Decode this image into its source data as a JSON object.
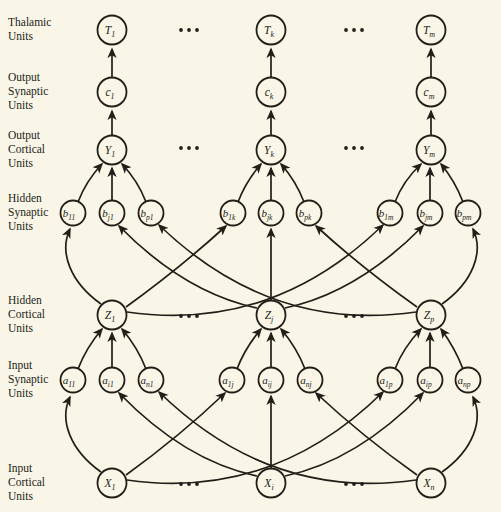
{
  "diagram": {
    "width": 501,
    "height": 512,
    "colors": {
      "background": "#f9f5e7",
      "ink": "#221e18"
    },
    "row_labels": [
      {
        "id": "thalamic-units",
        "lines": [
          "Thalamic",
          "Units"
        ],
        "x": 8,
        "y": 26
      },
      {
        "id": "output-synaptic-units",
        "lines": [
          "Output",
          "Synaptic",
          "Units"
        ],
        "x": 8,
        "y": 81
      },
      {
        "id": "output-cortical-units",
        "lines": [
          "Output",
          "Cortical",
          "Units"
        ],
        "x": 8,
        "y": 139
      },
      {
        "id": "hidden-synaptic-units",
        "lines": [
          "Hidden",
          "Synaptic",
          "Units"
        ],
        "x": 8,
        "y": 202
      },
      {
        "id": "hidden-cortical-units",
        "lines": [
          "Hidden",
          "Cortical",
          "Units"
        ],
        "x": 8,
        "y": 304
      },
      {
        "id": "input-synaptic-units",
        "lines": [
          "Input",
          "Synaptic",
          "Units"
        ],
        "x": 8,
        "y": 369
      },
      {
        "id": "input-cortical-units",
        "lines": [
          "Input",
          "Cortical",
          "Units"
        ],
        "x": 8,
        "y": 472
      }
    ],
    "nodes": [
      {
        "id": "T1",
        "base": "T",
        "sub": "1",
        "x": 112,
        "y": 30,
        "r": 14.5
      },
      {
        "id": "Tk",
        "base": "T",
        "sub": "k",
        "x": 271,
        "y": 30,
        "r": 14.5
      },
      {
        "id": "Tm",
        "base": "T",
        "sub": "m",
        "x": 431,
        "y": 30,
        "r": 14.5
      },
      {
        "id": "c1",
        "base": "c",
        "sub": "1",
        "x": 112,
        "y": 92,
        "r": 14.5
      },
      {
        "id": "ck",
        "base": "c",
        "sub": "k",
        "x": 271,
        "y": 92,
        "r": 14.5
      },
      {
        "id": "cm",
        "base": "c",
        "sub": "m",
        "x": 431,
        "y": 92,
        "r": 14.5
      },
      {
        "id": "Y1",
        "base": "Y",
        "sub": "1",
        "x": 112,
        "y": 150,
        "r": 14.5
      },
      {
        "id": "Yk",
        "base": "Y",
        "sub": "k",
        "x": 271,
        "y": 150,
        "r": 14.5
      },
      {
        "id": "Ym",
        "base": "Y",
        "sub": "m",
        "x": 431,
        "y": 150,
        "r": 14.5
      },
      {
        "id": "b11",
        "base": "b",
        "sub": "11",
        "x": 73,
        "y": 213,
        "r": 12.5
      },
      {
        "id": "bj1",
        "base": "b",
        "sub": "j1",
        "x": 112,
        "y": 213,
        "r": 12.5
      },
      {
        "id": "bp1",
        "base": "b",
        "sub": "p1",
        "x": 151,
        "y": 213,
        "r": 12.5
      },
      {
        "id": "b1k",
        "base": "b",
        "sub": "1k",
        "x": 233,
        "y": 213,
        "r": 12.5
      },
      {
        "id": "bjk",
        "base": "b",
        "sub": "jk",
        "x": 271,
        "y": 213,
        "r": 12.5
      },
      {
        "id": "bpk",
        "base": "b",
        "sub": "pk",
        "x": 309,
        "y": 213,
        "r": 12.5
      },
      {
        "id": "b1m",
        "base": "b",
        "sub": "1m",
        "x": 390,
        "y": 213,
        "r": 12.5
      },
      {
        "id": "bjm",
        "base": "b",
        "sub": "jm",
        "x": 430,
        "y": 213,
        "r": 12.5
      },
      {
        "id": "bpm",
        "base": "b",
        "sub": "pm",
        "x": 468,
        "y": 213,
        "r": 12.5
      },
      {
        "id": "Z1",
        "base": "Z",
        "sub": "1",
        "x": 112,
        "y": 315,
        "r": 14.5
      },
      {
        "id": "Zj",
        "base": "Z",
        "sub": "j",
        "x": 271,
        "y": 315,
        "r": 14.5
      },
      {
        "id": "Zp",
        "base": "Z",
        "sub": "p",
        "x": 431,
        "y": 315,
        "r": 14.5
      },
      {
        "id": "a11",
        "base": "a",
        "sub": "11",
        "x": 73,
        "y": 380,
        "r": 12.5
      },
      {
        "id": "ai1",
        "base": "a",
        "sub": "i1",
        "x": 112,
        "y": 380,
        "r": 12.5
      },
      {
        "id": "an1",
        "base": "a",
        "sub": "n1",
        "x": 151,
        "y": 380,
        "r": 12.5
      },
      {
        "id": "a1j",
        "base": "a",
        "sub": "1j",
        "x": 232,
        "y": 380,
        "r": 12.5
      },
      {
        "id": "aij",
        "base": "a",
        "sub": "ij",
        "x": 271,
        "y": 380,
        "r": 12.5
      },
      {
        "id": "anj",
        "base": "a",
        "sub": "nj",
        "x": 310,
        "y": 380,
        "r": 12.5
      },
      {
        "id": "a1p",
        "base": "a",
        "sub": "1p",
        "x": 390,
        "y": 380,
        "r": 12.5
      },
      {
        "id": "aip",
        "base": "a",
        "sub": "ip",
        "x": 430,
        "y": 380,
        "r": 12.5
      },
      {
        "id": "anp",
        "base": "a",
        "sub": "np",
        "x": 468,
        "y": 380,
        "r": 12.5
      }
    ],
    "edges": [
      {
        "from": "c1",
        "to": "T1",
        "d": "M112,77 L112,49"
      },
      {
        "from": "ck",
        "to": "Tk",
        "d": "M271,77 L271,49"
      },
      {
        "from": "cm",
        "to": "Tm",
        "d": "M431,77 L431,49"
      },
      {
        "from": "Y1",
        "to": "c1",
        "d": "M112,135 L112,111"
      },
      {
        "from": "Yk",
        "to": "ck",
        "d": "M271,135 L271,111"
      },
      {
        "from": "Ym",
        "to": "cm",
        "d": "M431,135 L431,111"
      },
      {
        "from": "b11",
        "to": "Y1",
        "d": "M78,202 Q86,181 102,164"
      },
      {
        "from": "bj1",
        "to": "Y1",
        "d": "M112,200 L112,168"
      },
      {
        "from": "bp1",
        "to": "Y1",
        "d": "M146,202 Q138,181 122,164"
      },
      {
        "from": "b1k",
        "to": "Yk",
        "d": "M238,202 Q246,181 261,164"
      },
      {
        "from": "bjk",
        "to": "Yk",
        "d": "M271,200 L271,168"
      },
      {
        "from": "bpk",
        "to": "Yk",
        "d": "M304,202 Q296,181 281,164"
      },
      {
        "from": "b1m",
        "to": "Ym",
        "d": "M395,202 Q403,181 421,164"
      },
      {
        "from": "bjm",
        "to": "Ym",
        "d": "M430,200 L430,168"
      },
      {
        "from": "bpm",
        "to": "Ym",
        "d": "M463,202 Q455,181 441,164"
      },
      {
        "from": "Z1",
        "to": "b11",
        "d": "M101,304 C70,282 59,252 70,229"
      },
      {
        "from": "Z1",
        "to": "b1k",
        "d": "M126,307 Q180,268 226,226"
      },
      {
        "from": "Z1",
        "to": "b1m",
        "d": "M127,312 Q272,333 383,225"
      },
      {
        "from": "Zj",
        "to": "bj1",
        "d": "M257,308 Q185,293 119,226"
      },
      {
        "from": "Zj",
        "to": "bjk",
        "d": "M271,300 L271,229"
      },
      {
        "from": "Zj",
        "to": "bjm",
        "d": "M285,308 Q357,293 423,226"
      },
      {
        "from": "Zp",
        "to": "bp1",
        "d": "M416,312 Q271,333 159,225"
      },
      {
        "from": "Zp",
        "to": "bpk",
        "d": "M417,307 Q362,268 316,226"
      },
      {
        "from": "Zp",
        "to": "bpm",
        "d": "M442,304 C473,282 484,252 473,229"
      },
      {
        "from": "a11",
        "to": "Z1",
        "d": "M78,369 Q86,348 102,329"
      },
      {
        "from": "ai1",
        "to": "Z1",
        "d": "M112,367 L112,333"
      },
      {
        "from": "an1",
        "to": "Z1",
        "d": "M146,369 Q138,348 122,329"
      },
      {
        "from": "a1j",
        "to": "Zj",
        "d": "M237,369 Q245,348 261,329"
      },
      {
        "from": "aij",
        "to": "Zj",
        "d": "M271,367 L271,333"
      },
      {
        "from": "anj",
        "to": "Zj",
        "d": "M305,369 Q297,348 281,329"
      },
      {
        "from": "a1p",
        "to": "Zp",
        "d": "M395,369 Q403,348 421,329"
      },
      {
        "from": "aip",
        "to": "Zp",
        "d": "M430,367 L430,333"
      },
      {
        "from": "anp",
        "to": "Zp",
        "d": "M463,369 Q455,348 441,329"
      },
      {
        "from": "X1",
        "to": "a11",
        "d": "M101,472 C70,450 59,420 70,397"
      },
      {
        "from": "X1",
        "to": "a1j",
        "d": "M126,475 Q180,436 225,393"
      },
      {
        "from": "X1",
        "to": "a1p",
        "d": "M127,480 Q272,501 383,392"
      },
      {
        "from": "Xi",
        "to": "ai1",
        "d": "M257,476 Q185,461 119,393"
      },
      {
        "from": "Xi",
        "to": "aij",
        "d": "M271,468 L271,396"
      },
      {
        "from": "Xi",
        "to": "aip",
        "d": "M285,476 Q357,461 423,393"
      },
      {
        "from": "Xn",
        "to": "an1",
        "d": "M416,480 Q271,501 159,392"
      },
      {
        "from": "Xn",
        "to": "anj",
        "d": "M417,475 Q362,436 316,393"
      },
      {
        "from": "Xn",
        "to": "anp",
        "d": "M442,472 C473,450 484,420 473,397"
      }
    ],
    "x_nodes": [
      {
        "id": "X1",
        "base": "X",
        "sub": "1",
        "x": 112,
        "y": 483,
        "r": 14.5
      },
      {
        "id": "Xi",
        "base": "X",
        "sub": "i",
        "x": 271,
        "y": 483,
        "r": 14.5
      },
      {
        "id": "Xn",
        "base": "X",
        "sub": "n",
        "x": 431,
        "y": 483,
        "r": 14.5
      }
    ],
    "ellipses": [
      {
        "x": 189,
        "y": 30
      },
      {
        "x": 354,
        "y": 30
      },
      {
        "x": 189,
        "y": 148
      },
      {
        "x": 354,
        "y": 148
      },
      {
        "x": 189,
        "y": 316
      },
      {
        "x": 354,
        "y": 316
      },
      {
        "x": 189,
        "y": 484
      },
      {
        "x": 354,
        "y": 484
      }
    ]
  }
}
